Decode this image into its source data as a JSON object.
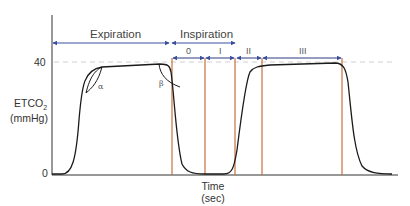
{
  "diagram": {
    "y_axis": {
      "label_line1": "ETCO",
      "label_sub": "2",
      "label_line2": "(mmHg)",
      "ticks": [
        "40",
        "0"
      ]
    },
    "x_axis": {
      "label_line1": "Time",
      "label_line2": "(sec)"
    },
    "segments": {
      "expiration": "Expiration",
      "inspiration": "Inspiration"
    },
    "phases": [
      "0",
      "I",
      "II",
      "III"
    ],
    "angles": {
      "alpha": "α",
      "beta": "β"
    },
    "colors": {
      "arrow": "#3b4fa0",
      "phase_line": "#c9713f",
      "waveform": "#1a1a1a",
      "reference_dash": "#cccccc",
      "axis": "#333333"
    }
  }
}
